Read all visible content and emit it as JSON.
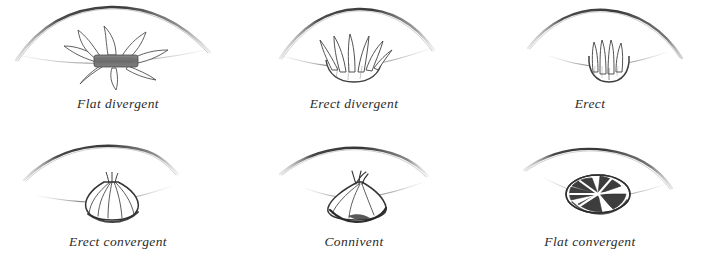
{
  "plate": {
    "title": "Anther arrangement types",
    "background_color": "#ffffff",
    "ink_color": "#3a3a3a",
    "shade_color": "#6f6f6f",
    "dark_fill": "#555555",
    "caption_color": "#2b2b2b",
    "columns": 3,
    "rows": 2
  },
  "figures": [
    {
      "id": "flat-divergent",
      "caption": "Flat divergent",
      "icon": "flat-divergent-anther-icon",
      "row": 1,
      "column": 1,
      "description": "Petals spread flat and outward from a dark horizontal central band"
    },
    {
      "id": "erect-divergent",
      "caption": "Erect divergent",
      "icon": "erect-divergent-anther-icon",
      "row": 1,
      "column": 2,
      "description": "Upright pointed anthers spreading apart from a rounded base"
    },
    {
      "id": "erect",
      "caption": "Erect",
      "icon": "erect-anther-icon",
      "row": 1,
      "column": 3,
      "description": "Narrow parallel upright anthers in a compact cup"
    },
    {
      "id": "erect-convergent",
      "caption": "Erect convergent",
      "icon": "erect-convergent-anther-icon",
      "row": 2,
      "column": 1,
      "description": "Bulb shape with anther lines converging to a single apex"
    },
    {
      "id": "connivent",
      "caption": "Connivent",
      "icon": "connivent-anther-icon",
      "row": 2,
      "column": 2,
      "description": "Dome or bell shape with small tips touching at the summit"
    },
    {
      "id": "flat-convergent",
      "caption": "Flat convergent",
      "icon": "flat-convergent-anther-icon",
      "row": 2,
      "column": 3,
      "description": "Flattened rosette seen from above with dark radiating segments"
    }
  ]
}
